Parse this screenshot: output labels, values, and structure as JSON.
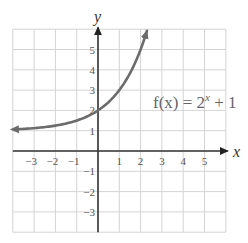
{
  "chart_data": {
    "type": "line",
    "title": "",
    "xlabel": "x",
    "ylabel": "y",
    "xlim": [
      -4,
      6
    ],
    "ylim": [
      -4,
      6
    ],
    "grid": true,
    "x_ticks": [
      "-3",
      "-2",
      "-1",
      "1",
      "2",
      "3",
      "4",
      "5"
    ],
    "y_ticks": [
      "5",
      "4",
      "3",
      "2",
      "1",
      "-1",
      "-2",
      "-3"
    ],
    "series": [
      {
        "name": "f(x) = 2^x + 1",
        "function": "2^x + 1",
        "x": [
          -4,
          -3,
          -2,
          -1,
          0,
          1,
          1.5,
          2.3
        ],
        "y": [
          1.0625,
          1.125,
          1.25,
          1.5,
          2,
          3,
          3.83,
          5.92
        ],
        "arrows": "both",
        "color": "#6b6b6b"
      }
    ],
    "annotations": [
      {
        "text_prefix": "f(x) = 2",
        "superscript": "x",
        "text_suffix": " + 1",
        "x": 2.6,
        "y": 2.2
      }
    ],
    "asymptote_hint": "y = 1 (horizontal, approached as x → -∞)"
  },
  "labels": {
    "x_axis": "x",
    "y_axis": "y",
    "function_prefix": "f(x) = 2",
    "function_sup": "x",
    "function_suffix": " + 1"
  },
  "colors": {
    "grid": "#d4d4d4",
    "axis": "#333333",
    "curve": "#6b6b6b"
  }
}
